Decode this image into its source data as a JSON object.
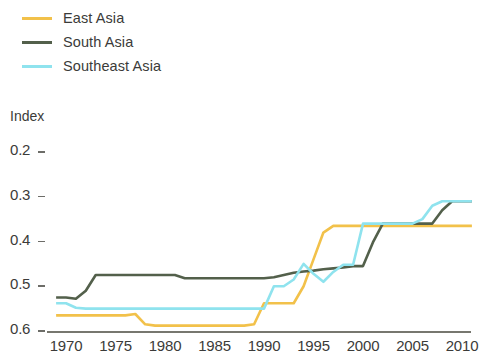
{
  "legend": {
    "position": "top-left",
    "items": [
      {
        "label": "East Asia",
        "color": "#f2c14a",
        "name": "legend-item-east-asia"
      },
      {
        "label": "South Asia",
        "color": "#53604b",
        "name": "legend-item-south-asia"
      },
      {
        "label": "Southeast Asia",
        "color": "#8fe3ee",
        "name": "legend-item-southeast-asia"
      }
    ]
  },
  "axis": {
    "y_title": "Index",
    "y_ticks": [
      "0.6",
      "0.5",
      "0.4",
      "0.3",
      "0.2"
    ],
    "x_ticks": [
      "1970",
      "1975",
      "1980",
      "1985",
      "1990",
      "1995",
      "2000",
      "2005",
      "2010"
    ]
  },
  "chart_data": {
    "type": "line",
    "title": "",
    "subtitle": "",
    "xlabel": "",
    "ylabel": "Index",
    "xlim": [
      1969,
      2011
    ],
    "ylim": [
      0.2,
      0.62
    ],
    "yticks": [
      0.2,
      0.3,
      0.4,
      0.5,
      0.6
    ],
    "xticks": [
      1970,
      1975,
      1980,
      1985,
      1990,
      1995,
      2000,
      2005,
      2010
    ],
    "grid": false,
    "legend_position": "top-left",
    "series": [
      {
        "name": "East Asia",
        "color": "#f2c14a",
        "x": [
          1969,
          1973,
          1976,
          1977,
          1978,
          1979,
          1988,
          1989,
          1990,
          1991,
          1992,
          1993,
          1994,
          1995,
          1996,
          1997,
          1998,
          2011
        ],
        "values": [
          0.235,
          0.235,
          0.235,
          0.238,
          0.215,
          0.212,
          0.212,
          0.215,
          0.262,
          0.262,
          0.262,
          0.262,
          0.3,
          0.36,
          0.42,
          0.435,
          0.435,
          0.435
        ]
      },
      {
        "name": "South Asia",
        "color": "#53604b",
        "x": [
          1969,
          1970,
          1971,
          1972,
          1973,
          1974,
          1981,
          1982,
          1983,
          1990,
          1991,
          1992,
          1993,
          1994,
          1995,
          1996,
          1997,
          1998,
          1999,
          2000,
          2001,
          2002,
          2003,
          2007,
          2008,
          2009,
          2011
        ],
        "values": [
          0.275,
          0.275,
          0.272,
          0.29,
          0.325,
          0.325,
          0.325,
          0.318,
          0.318,
          0.318,
          0.32,
          0.325,
          0.33,
          0.333,
          0.335,
          0.338,
          0.34,
          0.342,
          0.345,
          0.345,
          0.398,
          0.44,
          0.44,
          0.44,
          0.47,
          0.49,
          0.49
        ]
      },
      {
        "name": "Southeast Asia",
        "color": "#8fe3ee",
        "x": [
          1969,
          1970,
          1971,
          1972,
          1989,
          1990,
          1991,
          1992,
          1993,
          1994,
          1995,
          1996,
          1997,
          1998,
          1999,
          2000,
          2001,
          2005,
          2006,
          2007,
          2008,
          2009,
          2011
        ],
        "values": [
          0.262,
          0.262,
          0.252,
          0.25,
          0.25,
          0.25,
          0.3,
          0.3,
          0.315,
          0.35,
          0.328,
          0.31,
          0.332,
          0.348,
          0.348,
          0.44,
          0.44,
          0.44,
          0.45,
          0.48,
          0.49,
          0.49,
          0.49
        ]
      }
    ]
  }
}
